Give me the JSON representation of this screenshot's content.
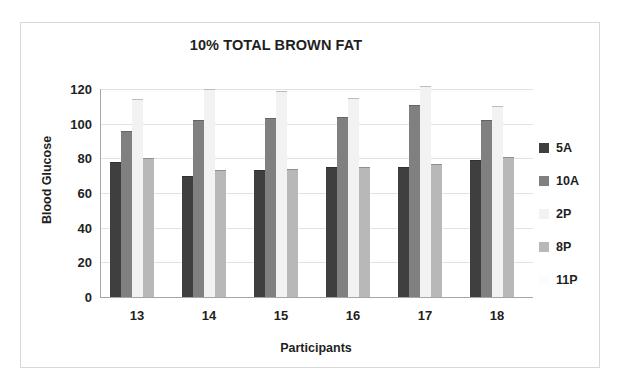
{
  "chart_data": {
    "type": "bar",
    "title": "10% TOTAL BROWN FAT",
    "xlabel": "Participants",
    "ylabel": "Blood Glucose",
    "categories": [
      "13",
      "14",
      "15",
      "16",
      "17",
      "18"
    ],
    "ylim": [
      0,
      120
    ],
    "yticks": [
      0,
      20,
      40,
      60,
      80,
      100,
      120
    ],
    "grid": true,
    "legend_position": "right",
    "series": [
      {
        "name": "5A",
        "color": "#3f3f3f",
        "values": [
          78,
          70,
          73,
          75,
          75,
          79
        ]
      },
      {
        "name": "10A",
        "color": "#808080",
        "values": [
          96,
          102,
          103,
          104,
          111,
          102
        ]
      },
      {
        "name": "2P",
        "color": "#f2f2f2",
        "values": [
          114,
          120,
          119,
          115,
          122,
          110
        ]
      },
      {
        "name": "8P",
        "color": "#b8b8b8",
        "values": [
          80,
          73,
          74,
          75,
          77,
          81
        ]
      },
      {
        "name": "11P",
        "color": "#fcfcfc",
        "values": [
          0,
          0,
          0,
          0,
          0,
          0
        ]
      }
    ]
  }
}
